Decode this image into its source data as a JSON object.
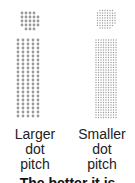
{
  "diagram": {
    "dot_color": "#9a9a9a",
    "left": {
      "label_lines": [
        "Larger",
        "dot",
        "pitch"
      ],
      "circle": {
        "cx": 29,
        "cy": 20,
        "r": 11,
        "pitch": 4
      },
      "grid": {
        "x0": 18,
        "y0": 40,
        "cols": 5,
        "rows": 20,
        "pitch": 5,
        "dot_r": 1.4
      }
    },
    "right": {
      "label_lines": [
        "Smaller",
        "dot",
        "pitch"
      ],
      "circle": {
        "cx": 106,
        "cy": 19,
        "r": 11,
        "pitch": 2.5
      },
      "grid": {
        "x0": 96,
        "y0": 40,
        "cols": 9,
        "rows": 32,
        "pitch": 2.5,
        "dot_r": 0.7
      }
    },
    "caption": "The better it is"
  }
}
